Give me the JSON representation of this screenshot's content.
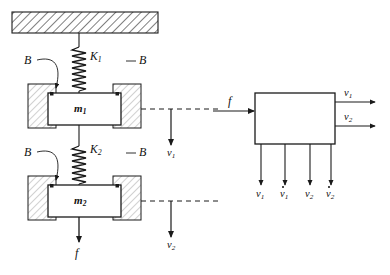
{
  "figure": {
    "background_color": "#ffffff",
    "ink_color": "#1a1a1a"
  },
  "mechanical_system": {
    "ceiling": {
      "name": "fixed support",
      "hatch_style": "diagonal"
    },
    "springs": [
      {
        "label": "K",
        "subscript": "1"
      },
      {
        "label": "K",
        "subscript": "2"
      }
    ],
    "masses": [
      {
        "label": "m",
        "subscript": "1"
      },
      {
        "label": "m",
        "subscript": "2"
      }
    ],
    "dampers": [
      {
        "label": "B",
        "position": "upper-left"
      },
      {
        "label": "B",
        "position": "upper-right"
      },
      {
        "label": "B",
        "position": "lower-left"
      },
      {
        "label": "B",
        "position": "lower-right"
      }
    ],
    "force": {
      "label": "f"
    },
    "velocities": [
      {
        "label": "v",
        "subscript": "1"
      },
      {
        "label": "v",
        "subscript": "2"
      }
    ]
  },
  "block_diagram": {
    "input": {
      "label": "f"
    },
    "outputs": [
      {
        "label": "v",
        "subscript": "1"
      },
      {
        "label": "v",
        "subscript": "2"
      }
    ],
    "bottom_signals": [
      {
        "label": "v",
        "subscript": "1",
        "dotted": false
      },
      {
        "label": "v",
        "subscript": "1",
        "dotted": true
      },
      {
        "label": "v",
        "subscript": "2",
        "dotted": false
      },
      {
        "label": "v",
        "subscript": "2",
        "dotted": true
      }
    ],
    "block": {
      "fill": "#ffffff",
      "stroke": "#1a1a1a"
    }
  }
}
